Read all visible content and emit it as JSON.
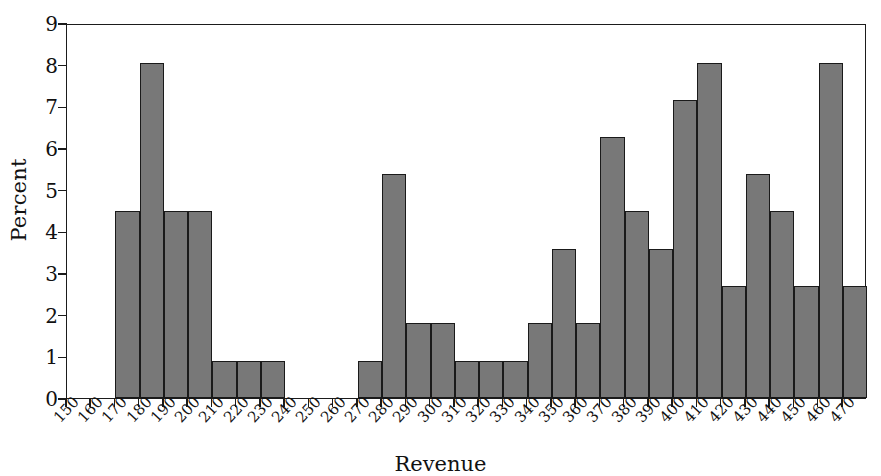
{
  "chart_data": {
    "type": "bar",
    "title": "",
    "subtitle": "",
    "xlabel": "Revenue",
    "ylabel": "Percent",
    "grid": false,
    "legend": null,
    "legend_position": "none",
    "orientation": "vertical",
    "bar_style": "histogram",
    "bar_fill_color": "#787878",
    "bar_edge_color": "#1a1a1a",
    "axis_color": "#1b1b1b",
    "background_color": "#ffffff",
    "xlim": [
      150,
      480
    ],
    "ylim": [
      0,
      9
    ],
    "y_tick_labels": [
      "0",
      "1",
      "2",
      "3",
      "4",
      "5",
      "6",
      "7",
      "8",
      "9"
    ],
    "y_tick_values": [
      0,
      1,
      2,
      3,
      4,
      5,
      6,
      7,
      8,
      9
    ],
    "x_tick_labels": [
      "150",
      "160",
      "170",
      "180",
      "190",
      "200",
      "210",
      "220",
      "230",
      "240",
      "250",
      "260",
      "270",
      "280",
      "290",
      "300",
      "310",
      "320",
      "330",
      "340",
      "350",
      "360",
      "370",
      "380",
      "390",
      "400",
      "410",
      "420",
      "430",
      "440",
      "450",
      "460",
      "470"
    ],
    "x_tick_values": [
      150,
      160,
      170,
      180,
      190,
      200,
      210,
      220,
      230,
      240,
      250,
      260,
      270,
      280,
      290,
      300,
      310,
      320,
      330,
      340,
      350,
      360,
      370,
      380,
      390,
      400,
      410,
      420,
      430,
      440,
      450,
      460,
      470
    ],
    "x_tick_rotation_deg": -47,
    "bin_width": 10,
    "bin_starts": [
      150,
      160,
      170,
      180,
      190,
      200,
      210,
      220,
      230,
      240,
      250,
      260,
      270,
      280,
      290,
      300,
      310,
      320,
      330,
      340,
      350,
      360,
      370,
      380,
      390,
      400,
      410,
      420,
      430,
      440,
      450,
      460,
      470
    ],
    "categories": [
      "150-160",
      "160-170",
      "170-180",
      "180-190",
      "190-200",
      "200-210",
      "210-220",
      "220-230",
      "230-240",
      "240-250",
      "250-260",
      "260-270",
      "270-280",
      "280-290",
      "290-300",
      "300-310",
      "310-320",
      "320-330",
      "330-340",
      "340-350",
      "350-360",
      "360-370",
      "370-380",
      "380-390",
      "390-400",
      "400-410",
      "410-420",
      "420-430",
      "430-440",
      "440-450",
      "450-460",
      "460-470",
      "470-480"
    ],
    "values": [
      0,
      0,
      4.48,
      8.05,
      4.48,
      4.48,
      0.9,
      0.9,
      0.9,
      0,
      0,
      0,
      0.9,
      5.37,
      1.79,
      1.79,
      0.9,
      0.9,
      0.9,
      1.79,
      3.58,
      1.79,
      6.27,
      4.48,
      3.58,
      7.16,
      8.05,
      2.69,
      5.37,
      4.48,
      2.69,
      8.05,
      2.69
    ]
  }
}
